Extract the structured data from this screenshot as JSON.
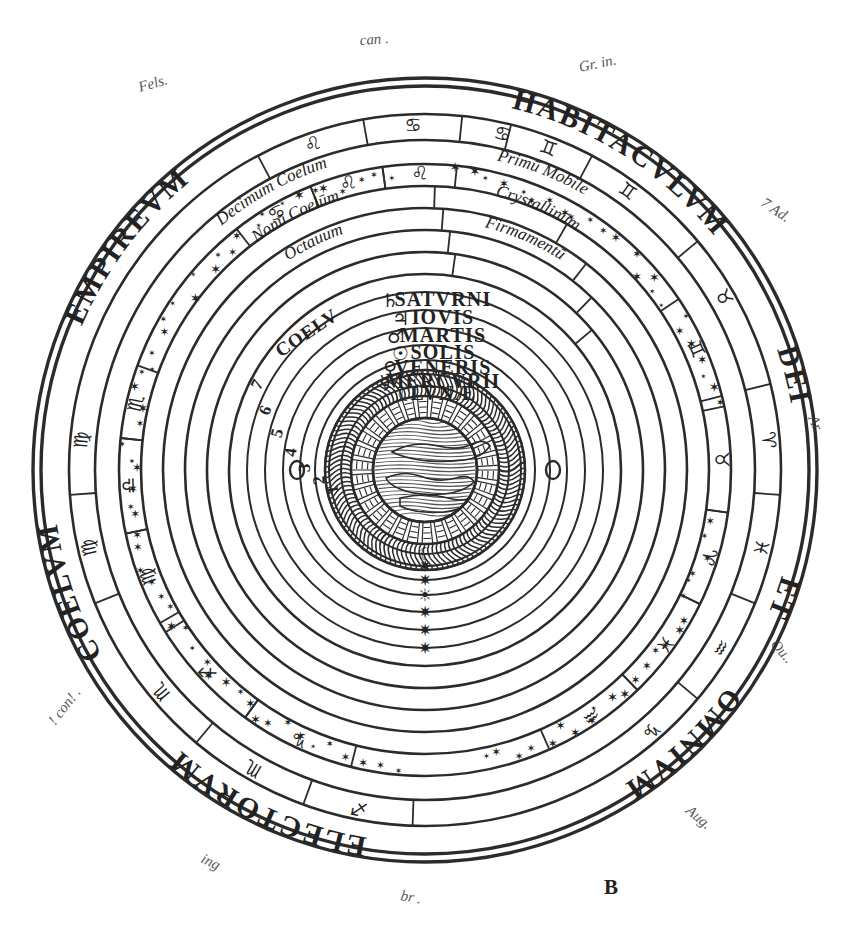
{
  "figure": {
    "label": "B",
    "type": "geocentric-cosmos-diagram",
    "title_inscription": "EMPIREVM HABITACVLVM DEI ET OMNIVM ELECTORVM COELVM"
  },
  "outer_inscription": [
    {
      "text": "EMPIREVM",
      "position": "top-left"
    },
    {
      "text": "HABITACVLVM",
      "position": "top-right"
    },
    {
      "text": "DEI",
      "position": "right"
    },
    {
      "text": "ET",
      "position": "right-lower"
    },
    {
      "text": "OMNIVM",
      "position": "bottom-right"
    },
    {
      "text": "ELECTORVM",
      "position": "bottom-left"
    },
    {
      "text": "COELVM",
      "position": "left"
    }
  ],
  "heaven_bands": [
    {
      "inner": "Decimum Coelum",
      "outer": "Primū Mobile"
    },
    {
      "inner": "Nonū Coelūm",
      "outer": "Crystallinūm"
    },
    {
      "inner": "Octauum",
      "outer": "Firmamentū"
    }
  ],
  "planetary_spheres": [
    {
      "numeral": "7",
      "symbol": "♄",
      "label": "SATVRNI",
      "prefix": "COELV"
    },
    {
      "numeral": "6",
      "symbol": "♃",
      "label": "IOVIS",
      "prefix": ""
    },
    {
      "numeral": "5",
      "symbol": "♂",
      "label": "MARTIS",
      "prefix": ""
    },
    {
      "numeral": "4",
      "symbol": "☉",
      "label": "SOLIS",
      "prefix": ""
    },
    {
      "numeral": "3",
      "symbol": "♀",
      "label": "VENERIS",
      "prefix": ""
    },
    {
      "numeral": "2",
      "symbol": "☿",
      "label": "MERCVRII",
      "prefix": ""
    },
    {
      "numeral": "1",
      "symbol": "☾",
      "label": "LVNÆ",
      "prefix": ""
    }
  ],
  "zodiac_outer": [
    "♌",
    "♋",
    "♋",
    "♍",
    "♍",
    "♏",
    "♏",
    "♐",
    "♑",
    "♒",
    "♓",
    "♈",
    "♉",
    "♊",
    "♊"
  ],
  "zodiac_inner": [
    "♋",
    "♌",
    "♌",
    "♍",
    "♎",
    "♏",
    "♐",
    "♑",
    "♒",
    "♓",
    "♈",
    "♉",
    "♊"
  ],
  "center": {
    "description": "terrestrial globe with earth, water, air and encircling ring of fire"
  },
  "planet_markers_bottom": [
    "☾",
    "✷",
    "✷",
    "☀",
    "✷",
    "✷",
    "✷",
    "✷"
  ],
  "marginalia": [
    {
      "text": "can .",
      "position": "top-center"
    },
    {
      "text": "Fels.",
      "position": "top-left"
    },
    {
      "text": "Gr. in.",
      "position": "top-right"
    },
    {
      "text": "7 Ad.",
      "position": "right-upper"
    },
    {
      "text": "Ar.",
      "position": "right-middle"
    },
    {
      "text": "Qu..",
      "position": "right-lower"
    },
    {
      "text": "Aug.",
      "position": "bottom-right"
    },
    {
      "text": "! con! .",
      "position": "left-lower"
    },
    {
      "text": "ing",
      "position": "bottom-left"
    },
    {
      "text": "br .",
      "position": "bottom-center"
    }
  ],
  "colors": {
    "ink": "#2b2b2b",
    "paper": "#ffffff",
    "marginalia": "#3a3a3a"
  }
}
